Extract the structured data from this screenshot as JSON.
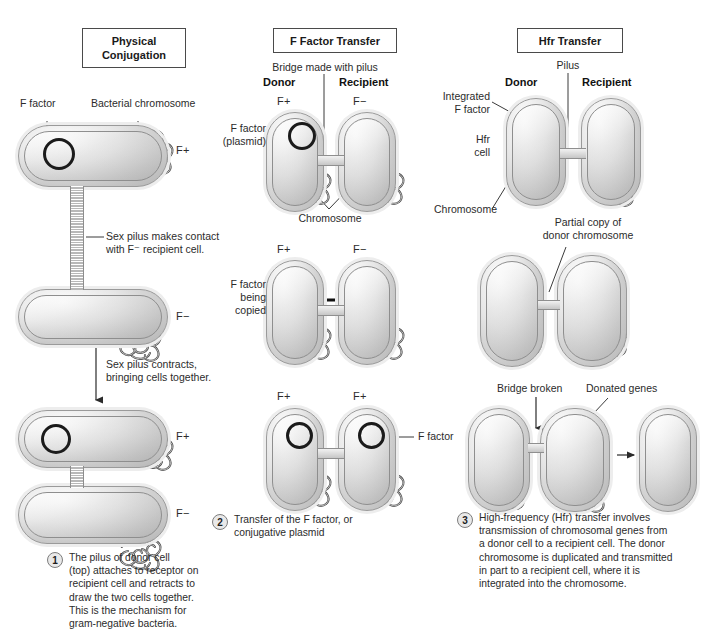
{
  "panels": {
    "physical": {
      "title": "Physical\nConjugation",
      "labels": {
        "f_factor": "F factor",
        "chromosome": "Bacterial chromosome",
        "pilus_contact": "Sex pilus makes contact\nwith F⁻ recipient cell.",
        "pilus_contract": "Sex pilus contracts,\nbringing cells together."
      },
      "markers": {
        "donor_top": "F+",
        "recipient_mid": "F−",
        "donor_bottom": "F+",
        "recipient_bottom": "F−"
      },
      "step": {
        "number": "1",
        "text": "The pilus of donor cell\n(top) attaches to receptor on\nrecipient cell and retracts to\ndraw the two cells together.\nThis is the mechanism for\ngram-negative bacteria."
      }
    },
    "ffactor": {
      "title": "F Factor Transfer",
      "labels": {
        "bridge": "Bridge made with pilus",
        "donor": "Donor",
        "recipient": "Recipient",
        "f_factor_plasmid": "F factor\n(plasmid)",
        "chromosome": "Chromosome",
        "f_factor_copied": "F factor\nbeing\ncopied",
        "f_factor_result": "F factor"
      },
      "markers": {
        "row1_left": "F+",
        "row1_right": "F−",
        "row2_left": "F+",
        "row2_right": "F−",
        "row3_left": "F+",
        "row3_right": "F+"
      },
      "step": {
        "number": "2",
        "text": "Transfer of the F factor, or\nconjugative plasmid"
      }
    },
    "hfr": {
      "title": "Hfr Transfer",
      "labels": {
        "pilus": "Pilus",
        "donor": "Donor",
        "recipient": "Recipient",
        "integrated_f_factor": "Integrated\nF factor",
        "hfr_cell": "Hfr\ncell",
        "chromosome": "Chromosome",
        "partial_copy": "Partial copy of\ndonor chromosome",
        "bridge_broken": "Bridge broken",
        "donated_genes": "Donated genes"
      },
      "step": {
        "number": "3",
        "text": "High-frequency (Hfr) transfer involves\ntransmission of chromosomal genes from\na donor cell to a recipient cell. The donor\nchromosome is duplicated and transmitted\nin part to a recipient cell, where it is\nintegrated into the chromosome."
      }
    }
  },
  "colors": {
    "ink": "#231f20",
    "line": "#3a3a3a",
    "cell_outline": "#9a9a9a",
    "dna": "#3f3f3f",
    "background": "#ffffff"
  }
}
